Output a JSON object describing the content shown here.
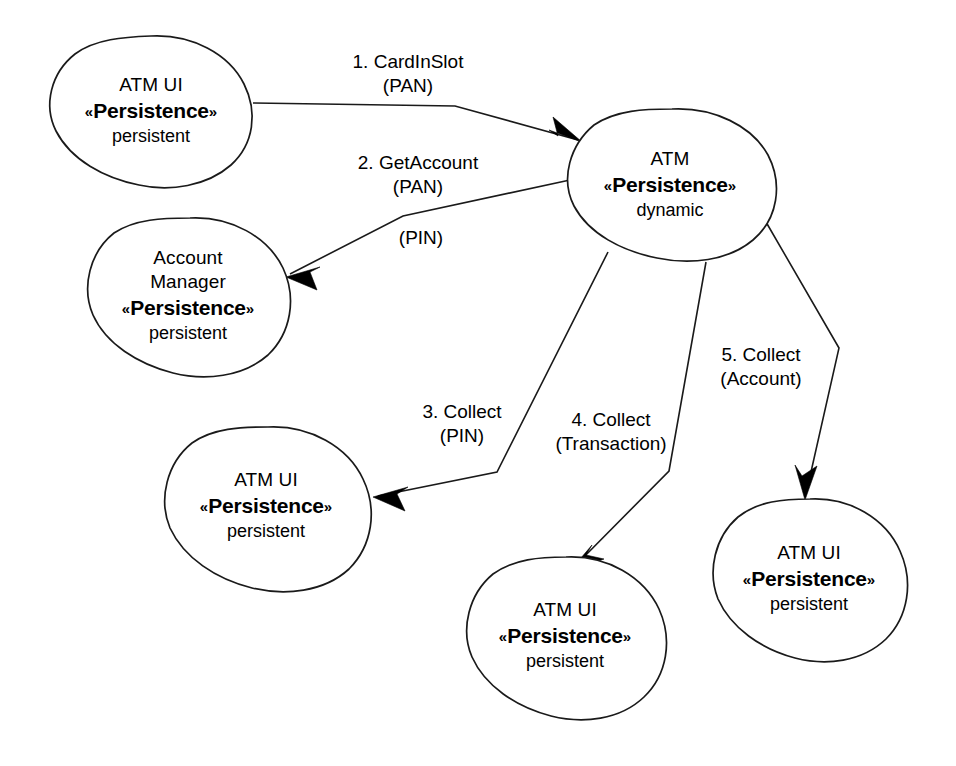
{
  "diagram": {
    "type": "uml-collaboration",
    "background_color": "#ffffff",
    "line_color": "#1a1a1a",
    "text_color": "#000000",
    "stereotype_open": "«",
    "stereotype_close": "»",
    "nodes": [
      {
        "id": "atm-ui-1",
        "name_line": "ATM UI",
        "stereotype": "Persistence",
        "tag": "persistent",
        "cx": 151,
        "cy": 110,
        "rx": 103,
        "ry": 74
      },
      {
        "id": "atm-dynamic",
        "name_line": "ATM",
        "stereotype": "Persistence",
        "tag": "dynamic",
        "cx": 670,
        "cy": 184,
        "rx": 103,
        "ry": 75
      },
      {
        "id": "account-manager",
        "name_line_a": "Account",
        "name_line_b": "Manager",
        "stereotype": "Persistence",
        "tag": "persistent",
        "cx": 188,
        "cy": 295,
        "rx": 103,
        "ry": 78
      },
      {
        "id": "atm-ui-3",
        "name_line": "ATM UI",
        "stereotype": "Persistence",
        "tag": "persistent",
        "cx": 266,
        "cy": 505,
        "rx": 103,
        "ry": 79
      },
      {
        "id": "atm-ui-4",
        "name_line": "ATM UI",
        "stereotype": "Persistence",
        "tag": "persistent",
        "cx": 565,
        "cy": 635,
        "rx": 101,
        "ry": 79
      },
      {
        "id": "atm-ui-5",
        "name_line": "ATM UI",
        "stereotype": "Persistence",
        "tag": "persistent",
        "cx": 809,
        "cy": 578,
        "rx": 98,
        "ry": 80
      }
    ],
    "messages": [
      {
        "id": "msg-1",
        "seq": "1. CardInSlot",
        "args": "(PAN)",
        "from": "atm-ui-1",
        "to": "atm-dynamic",
        "label_x": 408,
        "label_y": 74
      },
      {
        "id": "msg-2",
        "seq": "2. GetAccount",
        "args": "(PAN)",
        "from": "atm-dynamic",
        "to": "account-manager",
        "label_x": 418,
        "label_y": 175
      },
      {
        "id": "msg-2-pin",
        "seq": "",
        "args": "(PIN)",
        "from": "atm-dynamic",
        "to": "account-manager",
        "label_x": 421,
        "label_y": 238
      },
      {
        "id": "msg-3",
        "seq": "3. Collect",
        "args": "(PIN)",
        "from": "atm-dynamic",
        "to": "atm-ui-3",
        "label_x": 462,
        "label_y": 424
      },
      {
        "id": "msg-4",
        "seq": "4. Collect",
        "args": "(Transaction)",
        "from": "atm-dynamic",
        "to": "atm-ui-4",
        "label_x": 611,
        "label_y": 432
      },
      {
        "id": "msg-5",
        "seq": "5. Collect",
        "args": "(Account)",
        "from": "atm-dynamic",
        "to": "atm-ui-5",
        "label_x": 761,
        "label_y": 367
      }
    ]
  }
}
